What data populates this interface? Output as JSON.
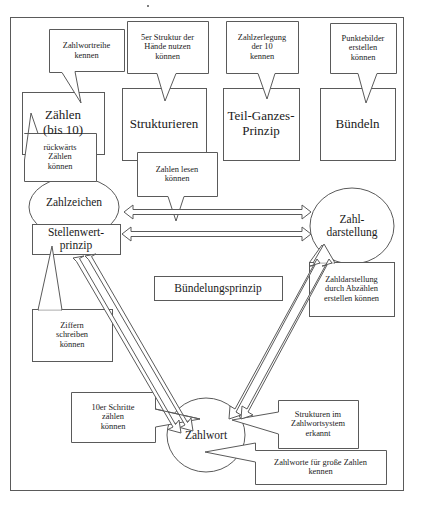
{
  "diagram": {
    "frame": {
      "name": "outer-frame"
    },
    "colors": {
      "stroke": "#5a5a5a",
      "text": "#1a1a1a",
      "background": "#ffffff"
    },
    "main_nodes": [
      {
        "id": "zaehlen",
        "label": "Zählen\n(bis 10)",
        "shape": "rect",
        "x": 22,
        "y": 92,
        "w": 82,
        "h": 62
      },
      {
        "id": "strukturieren",
        "label": "Strukturieren",
        "shape": "rect",
        "x": 122,
        "y": 88,
        "w": 84,
        "h": 72
      },
      {
        "id": "teil-ganzes",
        "label": "Teil-Ganzes-\nPrinzip",
        "shape": "rect",
        "x": 223,
        "y": 88,
        "w": 76,
        "h": 72
      },
      {
        "id": "buendeln",
        "label": "Bündeln",
        "shape": "rect",
        "x": 320,
        "y": 88,
        "w": 75,
        "h": 72
      },
      {
        "id": "zahlzeichen",
        "label": "Zahlzeichen",
        "shape": "ellipse",
        "x": 29,
        "y": 177,
        "w": 90,
        "h": 60
      },
      {
        "id": "stellenwert",
        "label": "Stellenwert-\nprinzip",
        "shape": "rect",
        "x": 32,
        "y": 224,
        "w": 88,
        "h": 30
      },
      {
        "id": "zahldarstellung",
        "label": "Zahl-\ndarstellung",
        "shape": "ellipse",
        "x": 310,
        "y": 188,
        "w": 84,
        "h": 76
      },
      {
        "id": "zahlwort",
        "label": "Zahlwort",
        "shape": "ellipse",
        "x": 167,
        "y": 398,
        "w": 78,
        "h": 74
      },
      {
        "id": "buendelungsprinzip",
        "label": "Bündelungsprinzip",
        "shape": "rect",
        "x": 154,
        "y": 276,
        "w": 128,
        "h": 24
      }
    ],
    "callouts": [
      {
        "id": "zahlwortreihe",
        "label": "Zahlwortreihe\nkennen",
        "x": 49,
        "y": 29,
        "w": 75,
        "h": 42,
        "target": "zaehlen"
      },
      {
        "id": "5er-struktur",
        "label": "5er Struktur der\nHände nutzen\nkönnen",
        "x": 127,
        "y": 21,
        "w": 81,
        "h": 52,
        "target": "strukturieren"
      },
      {
        "id": "zahlzerlegung",
        "label": "Zahlzerlegung\nder 10\nkennen",
        "x": 226,
        "y": 21,
        "w": 72,
        "h": 52,
        "target": "teil-ganzes"
      },
      {
        "id": "punktebilder",
        "label": "Punktebilder\nerstellen\nkönnen",
        "x": 330,
        "y": 23,
        "w": 66,
        "h": 50,
        "target": "buendeln"
      },
      {
        "id": "rueckwaerts-zaehlen",
        "label": "rückwärts\nZählen\nkönnen",
        "x": 24,
        "y": 133,
        "w": 72,
        "h": 48,
        "target": "zaehlen"
      },
      {
        "id": "zahlen-lesen",
        "label": "Zahlen lesen\nkönnen",
        "x": 137,
        "y": 152,
        "w": 80,
        "h": 44,
        "target": "zahl-arrow"
      },
      {
        "id": "zahldarst-abzaehlen",
        "label": "Zahldarstellung\ndurch Abzählen\nerstellen können",
        "x": 309,
        "y": 262,
        "w": 85,
        "h": 54,
        "target": "zahldarstellung"
      },
      {
        "id": "ziffern-schreiben",
        "label": "Ziffern\nschreiben\nkönnen",
        "x": 32,
        "y": 309,
        "w": 80,
        "h": 52,
        "target": "zahlzeichen"
      },
      {
        "id": "10er-schritte",
        "label": "10er Schritte\nzählen\nkönnen",
        "x": 71,
        "y": 392,
        "w": 84,
        "h": 50,
        "target": "zahlwort"
      },
      {
        "id": "strukturen-zahlwort",
        "label": "Strukturen im\nZahlwortsystem\nerkannt",
        "x": 278,
        "y": 400,
        "w": 80,
        "h": 48,
        "target": "zahlwort"
      },
      {
        "id": "zahlworte-grosse",
        "label": "Zahlworte für große Zahlen\nkennen",
        "x": 255,
        "y": 450,
        "w": 131,
        "h": 34,
        "target": "zahlwort"
      }
    ],
    "connections": [
      {
        "id": "zahlzeichen-zahldarstellung-right",
        "type": "block-arrow",
        "direction": "right",
        "from": "zahlzeichen",
        "to": "zahldarstellung"
      },
      {
        "id": "zahldarstellung-zahlzeichen-left",
        "type": "block-arrow",
        "direction": "left",
        "from": "zahldarstellung",
        "to": "zahlzeichen"
      },
      {
        "id": "stellenwert-zahlwort",
        "type": "block-arrow-double-diagonal",
        "from": "stellenwert",
        "to": "zahlwort"
      },
      {
        "id": "zahldarstellung-zahlwort",
        "type": "block-arrow-double-diagonal",
        "from": "zahldarstellung",
        "to": "zahlwort"
      }
    ]
  }
}
